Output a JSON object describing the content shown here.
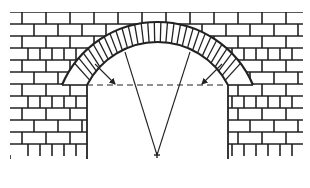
{
  "diagram": {
    "type": "segmental-brick-arch",
    "stroke_color": "#222222",
    "background": "#ffffff",
    "wall": {
      "left": 10,
      "right": 303,
      "top": 12,
      "bottom": 155,
      "course_height": 12
    },
    "opening": {
      "left_jamb_x": 87,
      "right_jamb_x": 228
    },
    "arch": {
      "spring_line_y": 85,
      "extrados": {
        "left_x": 62,
        "right_x": 253,
        "crown_y": 22
      },
      "intrados": {
        "left_x": 87,
        "right_x": 228,
        "crown_y": 42
      },
      "voussoir_count": 31
    },
    "construction": {
      "center_point": {
        "x": 157,
        "y": 155
      },
      "radial_lines": [
        {
          "from": [
            157,
            155
          ],
          "to": [
            125,
            52
          ]
        },
        {
          "from": [
            157,
            155
          ],
          "to": [
            190,
            52
          ]
        }
      ],
      "arrows": [
        {
          "from": [
            95,
            64
          ],
          "to": [
            115,
            84
          ]
        },
        {
          "from": [
            222,
            64
          ],
          "to": [
            202,
            84
          ]
        }
      ]
    }
  }
}
